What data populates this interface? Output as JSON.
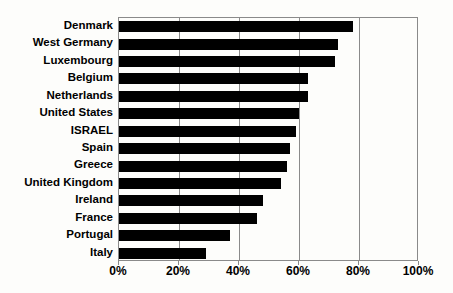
{
  "chart_data": {
    "type": "bar",
    "orientation": "horizontal",
    "title": "",
    "xlabel": "",
    "ylabel": "",
    "xlim": [
      0,
      100
    ],
    "xticks": [
      "0%",
      "20%",
      "40%",
      "60%",
      "80%",
      "100%"
    ],
    "xtick_values": [
      0,
      20,
      40,
      60,
      80,
      100
    ],
    "grid": "vertical",
    "legend": "none",
    "bar_color": "#000000",
    "categories": [
      "Denmark",
      "West Germany",
      "Luxembourg",
      "Belgium",
      "Netherlands",
      "United States",
      "ISRAEL",
      "Spain",
      "Greece",
      "United Kingdom",
      "Ireland",
      "France",
      "Portugal",
      "Italy"
    ],
    "values": [
      78,
      73,
      72,
      63,
      63,
      60,
      59,
      57,
      56,
      54,
      48,
      46,
      37,
      29
    ]
  }
}
